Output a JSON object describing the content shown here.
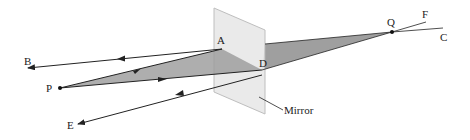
{
  "diagram": {
    "type": "plane-mirror-ray-diagram",
    "colors": {
      "background": "#ffffff",
      "ray": "#222222",
      "shade": "#9a9a9a",
      "shade_behind": "#8e8e8e",
      "mirror_fill": "#e6e6e6",
      "mirror_edge": "#b8b8b8"
    },
    "labels": {
      "A": "A",
      "B": "B",
      "C": "C",
      "D": "D",
      "E": "E",
      "F": "F",
      "P": "P",
      "Q": "Q",
      "mirror": "Mirror"
    },
    "points": {
      "P": [
        60,
        88
      ],
      "Q": [
        392,
        32
      ],
      "A": [
        222,
        49
      ],
      "D": [
        262,
        70
      ],
      "B": [
        28,
        68
      ],
      "E": [
        78,
        124
      ],
      "F": [
        426,
        22
      ],
      "C": [
        443,
        28
      ]
    },
    "rays": [
      {
        "from": "P",
        "to": "A",
        "label": "incident ray PA"
      },
      {
        "from": "P",
        "to": "D",
        "label": "incident ray PD"
      },
      {
        "from": "A",
        "to": "B",
        "label": "reflected ray AB"
      },
      {
        "from": "D",
        "to": "E",
        "label": "reflected ray DE"
      },
      {
        "from": "Q",
        "to": "F",
        "label": "virtual extension QF"
      },
      {
        "from": "Q",
        "to": "C",
        "label": "virtual extension QC"
      }
    ]
  }
}
